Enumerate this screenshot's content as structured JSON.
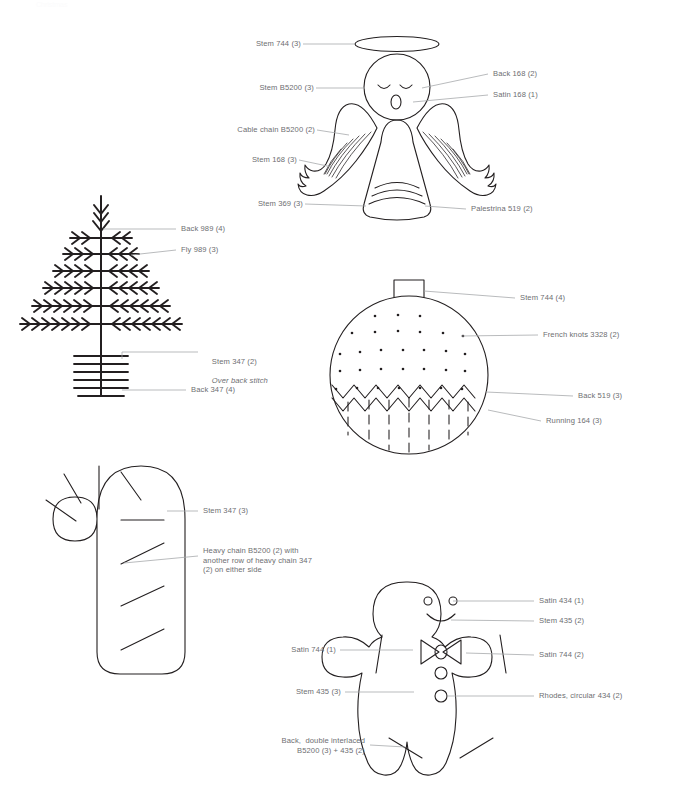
{
  "page": {
    "faint_header": "Christmas",
    "ink_color": "#231f20",
    "label_color": "#6d6e71",
    "leader_color": "#9a9b9e",
    "background": "#ffffff"
  },
  "motifs": [
    {
      "id": "angel",
      "name": "angel",
      "labels": [
        {
          "id": "angel-halo",
          "text": "Stem 744 (3)",
          "align": "right"
        },
        {
          "id": "angel-eyes",
          "text": "Back 168 (2)",
          "align": "left"
        },
        {
          "id": "angel-mouth",
          "text": "Satin 168 (1)",
          "align": "left"
        },
        {
          "id": "angel-head",
          "text": "Stem B5200 (3)",
          "align": "right"
        },
        {
          "id": "angel-wing-fill",
          "text": "Cable chain B5200 (2)",
          "align": "right"
        },
        {
          "id": "angel-wing-outline",
          "text": "Stem 168 (3)",
          "align": "right"
        },
        {
          "id": "angel-gown",
          "text": "Stem 369 (3)",
          "align": "right"
        },
        {
          "id": "angel-hem",
          "text": "Palestrina 519 (2)",
          "align": "left"
        }
      ]
    },
    {
      "id": "tree",
      "name": "christmas-tree",
      "labels": [
        {
          "id": "tree-trunk",
          "text": "Back 989 (4)",
          "align": "left"
        },
        {
          "id": "tree-branches",
          "text": "Fly 989 (3)",
          "align": "left"
        },
        {
          "id": "tree-pot-stem",
          "text": "Stem 347 (2)",
          "align": "left",
          "sub": "Over back stitch"
        },
        {
          "id": "tree-pot-back",
          "text": "Back 347 (4)",
          "align": "left"
        }
      ]
    },
    {
      "id": "bauble",
      "name": "bauble",
      "labels": [
        {
          "id": "bauble-cap",
          "text": "Stem 744 (4)",
          "align": "left"
        },
        {
          "id": "bauble-dots",
          "text": "French knots 3328 (2)",
          "align": "left"
        },
        {
          "id": "bauble-zigzag",
          "text": "Back 519 (3)",
          "align": "left"
        },
        {
          "id": "bauble-stripes",
          "text": "Running 164 (3)",
          "align": "left"
        }
      ]
    },
    {
      "id": "candy-cane",
      "name": "candy-cane",
      "labels": [
        {
          "id": "cane-outline",
          "text": "Stem 347 (3)",
          "align": "left"
        },
        {
          "id": "cane-stripes",
          "text": "Heavy chain B5200 (2) with\nanother row of heavy chain 347\n(2) on either side",
          "align": "left"
        }
      ]
    },
    {
      "id": "gingerbread",
      "name": "gingerbread-man",
      "labels": [
        {
          "id": "ginger-eyes",
          "text": "Satin 434 (1)",
          "align": "left"
        },
        {
          "id": "ginger-smile",
          "text": "Stem 435 (2)",
          "align": "left"
        },
        {
          "id": "ginger-bowtie-left",
          "text": "Satin 744 (1)",
          "align": "right"
        },
        {
          "id": "ginger-bowtie-right",
          "text": "Satin 744 (2)",
          "align": "left"
        },
        {
          "id": "ginger-body",
          "text": "Stem 435 (3)",
          "align": "right"
        },
        {
          "id": "ginger-buttons",
          "text": "Rhodes, circular 434 (2)",
          "align": "left"
        },
        {
          "id": "ginger-cuffs",
          "text": "Back,  double interlaced\nB5200 (3) + 435 (2)",
          "align": "right"
        }
      ]
    }
  ]
}
